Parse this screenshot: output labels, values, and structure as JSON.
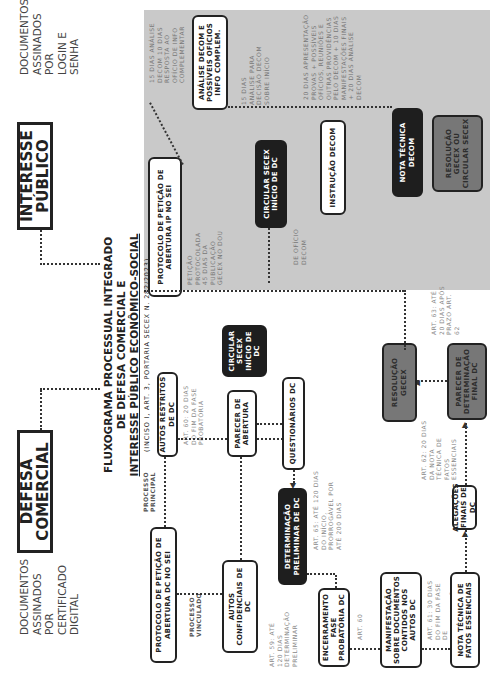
{
  "title": {
    "line1": "FLUXOGRAMA PROCESSUAL INTEGRADO",
    "line2": "DE DEFESA COMERCIAL E",
    "line3": "INTERESSE PÚBLICO ECONÔMICO-SOCIAL",
    "subtitle": "(INCISO I, ART. 3, PORTARIA SECEX N. 282/2023)"
  },
  "sections": {
    "defesa_comercial": {
      "label": "DEFESA COMERCIAL",
      "docs_note": "DOCUMENTOS ASSINADOS POR CERTIFICADO DIGITAL"
    },
    "interesse_publico": {
      "label": "INTERESSE PÚBLICO",
      "docs_note": "DOCUMENTOS ASSINADOS POR LOGIN E SENHA"
    }
  },
  "interesse_publico_flow": {
    "protocolo": "PROTOCOLO DE PETIÇÃO DE ABERTURA IP NO SEI",
    "protocolo_note": "PETIÇÃO PROTOCOLADA 45 DIAS DA PUBLICAÇÃO GECEX NO DOU",
    "analise": "ANÁLISE DECOM E POSSÍVEIS OFÍCIOS INFO COMPLEM.",
    "analise_note": "15 DIAS ANÁLISE DECOM 10 DIAS RESPOSTA AO OFÍCIO DE INFO COMPLEMENTAR",
    "circular_inicio": "CIRCULAR SECEX INÍCIO DE DC",
    "circular_note": "15 DIAS ANÁLISE PARA DECISÃO DECOM SOBRE INÍCIO",
    "de_oficio": "DE OFÍCIO DECOM",
    "instrucao": "INSTRUÇÃO DECOM",
    "instrucao_note": "20 DIAS APRESENTAÇÃO PROVAS + POSSÍVEIS OFÍCIOS, REUNIÕES E OUTRAS PROVIDÊNCIAS PELO DECOM + 10 DIAS MANIFESTAÇÕES FINAIS + 20 DIAS ANÁLISE DECOM",
    "nota_tecnica": "NOTA TÉCNICA DECOM",
    "resolucao": "RESOLUÇÃO GECEX OU CIRCULAR SECEX"
  },
  "defesa_comercial_flow": {
    "protocolo": "PROTOCOLO DE PETIÇÃO DE ABERTURA DC NO SEI",
    "processo_principal": "PROCESSO PRINCIPAL",
    "processo_vinculado": "PROCESSO VINCULADO",
    "autos_restritos": "AUTOS RESTRITOS DE DC",
    "autos_restritos_note": "ART. 60: 20 DIAS DO FIM DA FASE PROBATÓRIA",
    "autos_confidenciais": "AUTOS CONFIDENCIAIS DE DC",
    "autos_confidenciais_note": "ART. 59: ATÉ 120 DIAS DETERMINAÇÃO PRELIMINAR",
    "circular_secex": "CIRCULAR SECEX INÍCIO DE DC",
    "parecer_abertura": "PARECER DE ABERTURA",
    "questionarios": "QUESTIONÁRIOS DC",
    "determinacao_preliminar": "DETERMINAÇÃO PRELIMINAR DE DC",
    "determinacao_preliminar_note": "ART. 65: ATÉ 120 DIAS DO INÍCIO, PRORROGÁVEL POR ATÉ 200 DIAS",
    "encerramento": "ENCERRAMENTO FASE PROBATÓRIA DC",
    "encerramento_note": "ART. 60",
    "manifestacao": "MANIFESTAÇÃO SOBRE DOCUMENTOS CONTIDOS NOS AUTOS DC",
    "manifestacao_note": "ART. 61: 30 DIAS DO FIM DA FASE DE MANIFESTAÇÕES",
    "nota_tecnica": "NOTA TÉCNICA DE FATOS ESSENCIAIS",
    "alegacoes": "ALEGAÇÕES FINAIS DE DC",
    "alegacoes_note": "ART. 62: 20 DIAS DA NOTA TÉCNICA DE FATOS ESSENCIAIS",
    "parecer_final": "PARECER DE DETERMINAÇÃO FINAL DC",
    "parecer_final_note": "ART. 63: ATÉ 20 DIAS APÓS PRAZO ART. 62",
    "resolucao": "RESOLUÇÃO GECEX"
  },
  "colors": {
    "panel_gray": "#c9c9c9",
    "box_black": "#1e1e1e",
    "box_gray": "#777777",
    "border": "#222222"
  }
}
